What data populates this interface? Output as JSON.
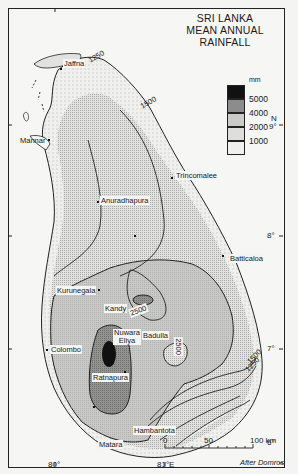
{
  "title": {
    "line1": "SRI LANKA",
    "line2": "MEAN ANNUAL RAINFALL"
  },
  "legend": {
    "unit": "mm",
    "classes": [
      {
        "label": "5000",
        "fill": "#111111",
        "description": "over 5000"
      },
      {
        "label": "4000",
        "fill": "#8c8c8c",
        "description": "4000-5000"
      },
      {
        "label": "2000",
        "fill": "#c8c8c6",
        "description": "2000-4000"
      },
      {
        "label": "1000",
        "fill": "#dcdcda",
        "description": "1000-2000"
      },
      {
        "label": "",
        "fill": "#efefed",
        "description": "under 1000"
      }
    ]
  },
  "places": [
    {
      "name": "Jaffna"
    },
    {
      "name": "Mannar"
    },
    {
      "name": "Trincomalee"
    },
    {
      "name": "Anuradhapura"
    },
    {
      "name": "Batticaloa"
    },
    {
      "name": "Kurunegala"
    },
    {
      "name": "Kandy"
    },
    {
      "name": "Nuwara Eliya"
    },
    {
      "name": "Badulla"
    },
    {
      "name": "Colombo"
    },
    {
      "name": "Ratnapura"
    },
    {
      "name": "Hambantota"
    },
    {
      "name": "Matara"
    }
  ],
  "isohyet_labels": [
    "1250",
    "1500",
    "2500",
    "2500",
    "1500",
    "1250"
  ],
  "latitude_ticks": [
    {
      "label": "N\n9°"
    },
    {
      "label": "8°"
    },
    {
      "label": "7°"
    },
    {
      "label": "6°"
    }
  ],
  "longitude_ticks": [
    {
      "label": "80°"
    },
    {
      "label": "81°E"
    }
  ],
  "scale_bar": {
    "labels": [
      "0",
      "50",
      "100 km"
    ]
  },
  "credit": "After Domros"
}
